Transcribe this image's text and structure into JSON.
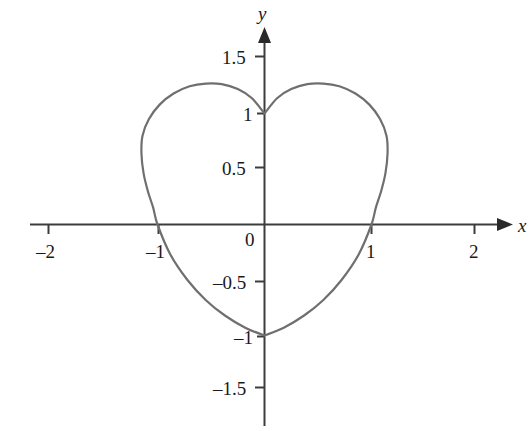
{
  "figure": {
    "background_color": "#ffffff",
    "axis_color": "#3c3c3c",
    "curve_color": "#6f6f6f",
    "text_color": "#1a1a1a"
  },
  "axes": {
    "x_axis_name": "x",
    "y_axis_name": "y",
    "origin_label": "0"
  },
  "x_ticks": [
    {
      "label": "–2",
      "value": -2,
      "px": 48
    },
    {
      "label": "–1",
      "value": -1,
      "px": 158
    },
    {
      "label": "1",
      "value": 1,
      "px": 371
    },
    {
      "label": "2",
      "value": 2,
      "px": 474
    }
  ],
  "y_ticks": [
    {
      "label": "1.5",
      "value": 1.5,
      "px": 56
    },
    {
      "label": "1",
      "value": 1,
      "px": 113
    },
    {
      "label": "0.5",
      "value": 0.5,
      "px": 167
    },
    {
      "label": "–0.5",
      "value": -0.5,
      "px": 281
    },
    {
      "label": "–1",
      "value": -1,
      "px": 336
    },
    {
      "label": "–1.5",
      "value": -1.5,
      "px": 387
    }
  ],
  "chart_data": {
    "type": "line",
    "title": "",
    "subtitle": "",
    "xlabel": "x",
    "ylabel": "y",
    "xlim": [
      -2.2,
      2.3
    ],
    "ylim": [
      -1.8,
      1.8
    ],
    "grid": false,
    "legend": null,
    "annotations": [],
    "x_tick_values": [
      -2,
      -1,
      1,
      2
    ],
    "x_tick_labels": [
      "–2",
      "–1",
      "1",
      "2"
    ],
    "y_tick_values": [
      1.5,
      1,
      0.5,
      -0.5,
      -1,
      -1.5
    ],
    "y_tick_labels": [
      "1.5",
      "1",
      "0.5",
      "–0.5",
      "–1",
      "–1.5"
    ],
    "series": [
      {
        "name": "heart curve",
        "closed": true,
        "description": "Heart-shaped closed curve, symmetric about the y-axis; cusp at (0, 1), lower vertex at (0, -1), lobe peaks near y = 1.27, widest at x = ±1.15 (y ≈ 0.64), crosses x-axis at x = ±1.",
        "key_points": [
          {
            "x": 0,
            "y": 1
          },
          {
            "x": 0.55,
            "y": 1.27
          },
          {
            "x": 1.15,
            "y": 0.64
          },
          {
            "x": 1,
            "y": 0
          },
          {
            "x": 0,
            "y": -1
          },
          {
            "x": -1,
            "y": 0
          },
          {
            "x": -1.15,
            "y": 0.64
          },
          {
            "x": -0.55,
            "y": 1.27
          }
        ],
        "points": [
          {
            "x": 0.0,
            "y": 1.0
          },
          {
            "x": 0.12,
            "y": 1.14
          },
          {
            "x": 0.25,
            "y": 1.22
          },
          {
            "x": 0.4,
            "y": 1.265
          },
          {
            "x": 0.55,
            "y": 1.27
          },
          {
            "x": 0.7,
            "y": 1.245
          },
          {
            "x": 0.85,
            "y": 1.18
          },
          {
            "x": 0.98,
            "y": 1.08
          },
          {
            "x": 1.08,
            "y": 0.95
          },
          {
            "x": 1.14,
            "y": 0.8
          },
          {
            "x": 1.15,
            "y": 0.64
          },
          {
            "x": 1.13,
            "y": 0.46
          },
          {
            "x": 1.09,
            "y": 0.3
          },
          {
            "x": 1.04,
            "y": 0.15
          },
          {
            "x": 1.0,
            "y": 0.0
          },
          {
            "x": 0.88,
            "y": -0.27
          },
          {
            "x": 0.72,
            "y": -0.5
          },
          {
            "x": 0.55,
            "y": -0.68
          },
          {
            "x": 0.37,
            "y": -0.82
          },
          {
            "x": 0.18,
            "y": -0.93
          },
          {
            "x": 0.0,
            "y": -1.0
          },
          {
            "x": -0.18,
            "y": -0.93
          },
          {
            "x": -0.37,
            "y": -0.82
          },
          {
            "x": -0.55,
            "y": -0.68
          },
          {
            "x": -0.72,
            "y": -0.5
          },
          {
            "x": -0.88,
            "y": -0.27
          },
          {
            "x": -1.0,
            "y": 0.0
          },
          {
            "x": -1.04,
            "y": 0.15
          },
          {
            "x": -1.09,
            "y": 0.3
          },
          {
            "x": -1.13,
            "y": 0.46
          },
          {
            "x": -1.15,
            "y": 0.64
          },
          {
            "x": -1.14,
            "y": 0.8
          },
          {
            "x": -1.08,
            "y": 0.95
          },
          {
            "x": -0.98,
            "y": 1.08
          },
          {
            "x": -0.85,
            "y": 1.18
          },
          {
            "x": -0.7,
            "y": 1.245
          },
          {
            "x": -0.55,
            "y": 1.27
          },
          {
            "x": -0.4,
            "y": 1.265
          },
          {
            "x": -0.25,
            "y": 1.22
          },
          {
            "x": -0.12,
            "y": 1.14
          },
          {
            "x": 0.0,
            "y": 1.0
          }
        ]
      }
    ]
  }
}
